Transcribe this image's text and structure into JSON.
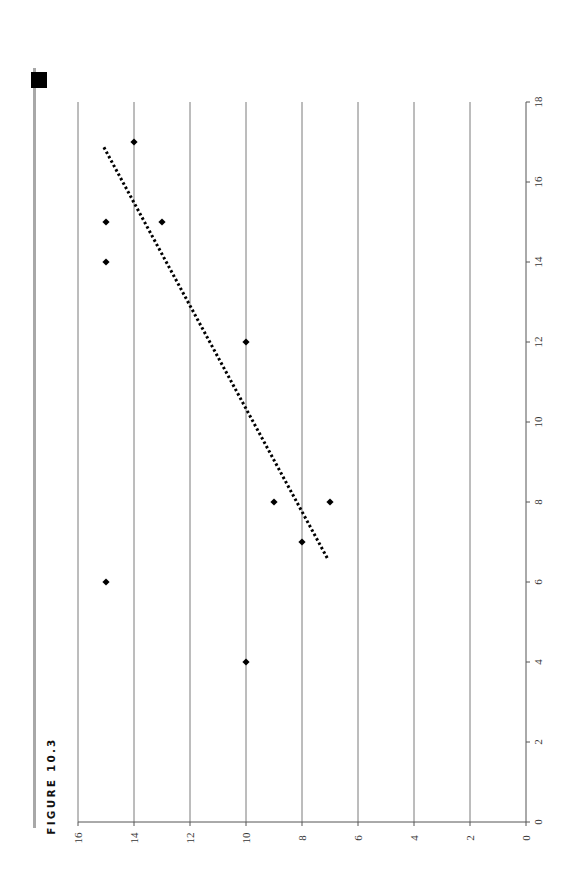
{
  "figure": {
    "label": "FIGURE 10.3",
    "orientation": "rotated 90° counter-clockwise"
  },
  "chart_data": {
    "type": "scatter",
    "title": "",
    "xlabel": "",
    "ylabel": "",
    "xlim": [
      0,
      18
    ],
    "ylim": [
      0,
      16
    ],
    "x_ticks": [
      0,
      2,
      4,
      6,
      8,
      10,
      12,
      14,
      16,
      18
    ],
    "y_ticks": [
      0,
      2,
      4,
      6,
      8,
      10,
      12,
      14,
      16
    ],
    "grid": "horizontal gridlines at each y tick",
    "legend": "none",
    "series": [
      {
        "name": "data",
        "marker": "diamond",
        "color": "#000000",
        "points": [
          {
            "x": 4,
            "y": 10
          },
          {
            "x": 6,
            "y": 15
          },
          {
            "x": 7,
            "y": 8
          },
          {
            "x": 8,
            "y": 9
          },
          {
            "x": 8,
            "y": 7
          },
          {
            "x": 12,
            "y": 10
          },
          {
            "x": 14,
            "y": 15
          },
          {
            "x": 15,
            "y": 15
          },
          {
            "x": 15,
            "y": 13
          },
          {
            "x": 17,
            "y": 14
          }
        ]
      }
    ],
    "trendline": {
      "style": "dotted",
      "color": "#000000",
      "start": {
        "x": 6.6,
        "y": 7.1
      },
      "end": {
        "x": 16.9,
        "y": 15.1
      }
    }
  }
}
